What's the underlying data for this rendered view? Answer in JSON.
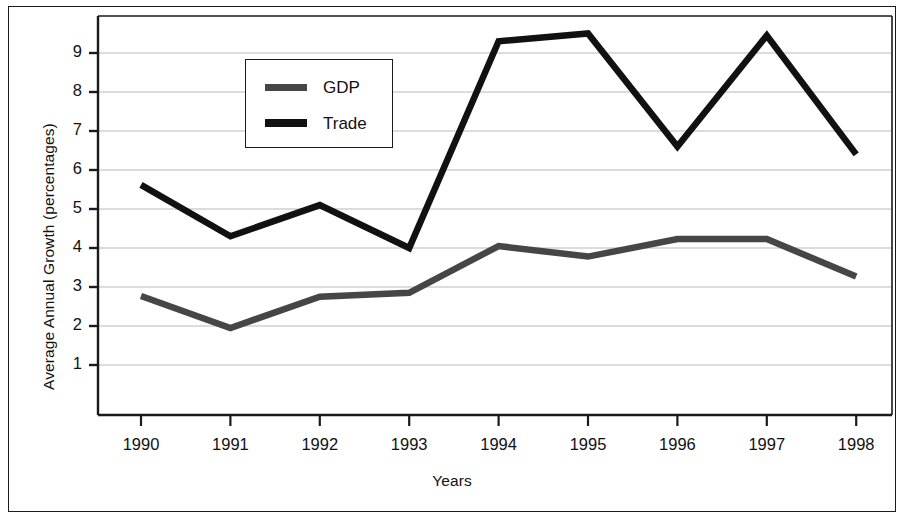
{
  "chart_data": {
    "type": "line",
    "title": "",
    "subtitle": "",
    "xlabel": "Years",
    "ylabel": "Average Annual Growth (percentages)",
    "categories": [
      "1990",
      "1991",
      "1992",
      "1993",
      "1994",
      "1995",
      "1996",
      "1997",
      "1998"
    ],
    "x": [
      1990,
      1991,
      1992,
      1993,
      1994,
      1995,
      1996,
      1997,
      1998
    ],
    "series": [
      {
        "name": "GDP",
        "color": "#464646",
        "values": [
          2.77,
          1.95,
          2.75,
          2.85,
          4.05,
          3.78,
          4.23,
          4.23,
          3.27
        ]
      },
      {
        "name": "Trade",
        "color": "#111111",
        "values": [
          5.62,
          4.3,
          5.1,
          4.0,
          9.3,
          9.5,
          6.6,
          9.45,
          6.4
        ]
      }
    ],
    "ylim": [
      0,
      9.8
    ],
    "yticks": [
      1,
      2,
      3,
      4,
      5,
      6,
      7,
      8,
      9
    ],
    "ytick_labels": [
      "1",
      "2",
      "3",
      "4",
      "5",
      "6",
      "7",
      "8",
      "9"
    ],
    "xlim": [
      1990,
      1998
    ],
    "grid": true,
    "grid_axis": "y",
    "grid_color": "#b9b9b9",
    "legend": {
      "position": "upper-center-left",
      "entries": [
        {
          "label": "GDP",
          "color": "#464646"
        },
        {
          "label": "Trade",
          "color": "#111111"
        }
      ]
    },
    "axis_color": "#1a1a1a",
    "background": "#ffffff",
    "frame": true
  }
}
